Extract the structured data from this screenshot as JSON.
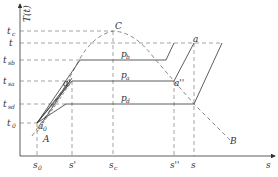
{
  "diagram": {
    "y_axis_label": "T(t)",
    "x_axis_label": "s",
    "y_ticks": [
      {
        "id": "tc",
        "label": "t",
        "sub": "c",
        "y": 31
      },
      {
        "id": "t",
        "label": "t",
        "sub": "",
        "y": 43
      },
      {
        "id": "tsb",
        "label": "t",
        "sub": "sb",
        "y": 60
      },
      {
        "id": "tsa",
        "label": "t",
        "sub": "sa",
        "y": 81
      },
      {
        "id": "tsd",
        "label": "t",
        "sub": "sd",
        "y": 104
      },
      {
        "id": "t0",
        "label": "t",
        "sub": "0",
        "y": 123
      }
    ],
    "x_ticks": [
      {
        "id": "s0",
        "label": "s",
        "sub": "0",
        "x": 37
      },
      {
        "id": "s1",
        "label": "s'",
        "sub": "",
        "x": 72
      },
      {
        "id": "sc",
        "label": "s",
        "sub": "c",
        "x": 113
      },
      {
        "id": "s2",
        "label": "s''",
        "sub": "",
        "x": 174
      },
      {
        "id": "s",
        "label": "s",
        "sub": "",
        "x": 194
      }
    ],
    "points": {
      "C": "C",
      "A": "A",
      "B": "B",
      "a": "a",
      "a0": "a",
      "a0_sub": "0",
      "a1": "a'",
      "a2": "a''"
    },
    "pressure_labels": {
      "pb": "p",
      "pb_sub": "b",
      "pa": "p",
      "pa_sub": "a",
      "pd": "p",
      "pd_sub": "d"
    },
    "colors": {
      "line": "#333333",
      "dashed": "#555555",
      "background": "#ffffff"
    }
  }
}
